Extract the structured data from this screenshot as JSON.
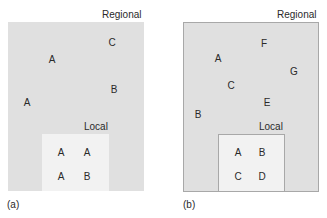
{
  "panels": [
    {
      "caption": "(a)",
      "regional_label": "Regional",
      "local_label": "Local",
      "regional_points": [
        {
          "label": "C",
          "x": 112,
          "y": 43
        },
        {
          "label": "A",
          "x": 52,
          "y": 60
        },
        {
          "label": "B",
          "x": 114,
          "y": 90
        },
        {
          "label": "A",
          "x": 27,
          "y": 103
        }
      ],
      "local_points": [
        {
          "label": "A",
          "x": 61,
          "y": 153
        },
        {
          "label": "A",
          "x": 87,
          "y": 153
        },
        {
          "label": "A",
          "x": 61,
          "y": 177
        },
        {
          "label": "B",
          "x": 87,
          "y": 177
        }
      ]
    },
    {
      "caption": "(b)",
      "regional_label": "Regional",
      "local_label": "Local",
      "regional_points": [
        {
          "label": "F",
          "x": 264,
          "y": 44
        },
        {
          "label": "A",
          "x": 218,
          "y": 59
        },
        {
          "label": "G",
          "x": 294,
          "y": 72
        },
        {
          "label": "C",
          "x": 231,
          "y": 86
        },
        {
          "label": "E",
          "x": 267,
          "y": 103
        },
        {
          "label": "B",
          "x": 198,
          "y": 115
        }
      ],
      "local_points": [
        {
          "label": "A",
          "x": 238,
          "y": 153
        },
        {
          "label": "B",
          "x": 262,
          "y": 153
        },
        {
          "label": "C",
          "x": 238,
          "y": 177
        },
        {
          "label": "D",
          "x": 262,
          "y": 177
        }
      ]
    }
  ],
  "colors": {
    "regional_fill": "#e0e0e0",
    "local_fill": "#f2f2f2",
    "border": "#a8a8a8",
    "text": "#2a2a2a"
  }
}
